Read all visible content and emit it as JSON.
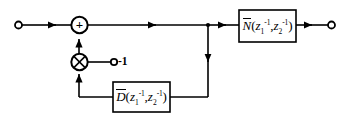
{
  "figure": {
    "kind": "signal-flow-block-diagram",
    "background_color": "#ffffff",
    "line_color": "#000000",
    "width": 351,
    "height": 124
  },
  "nodes": {
    "input_terminal": {
      "name": "input-terminal",
      "shape": "open-circle",
      "label": ""
    },
    "output_terminal": {
      "name": "output-terminal",
      "shape": "open-circle",
      "label": ""
    },
    "summing_junction": {
      "name": "summing-junction",
      "shape": "circle",
      "sign": "+"
    },
    "multiplier": {
      "name": "multiplier-node",
      "shape": "circle-with-cross",
      "symbol": "⊗"
    },
    "gain_terminal": {
      "name": "gain-terminal",
      "shape": "open-circle",
      "label": "-1"
    },
    "branch_point": {
      "name": "branch-point",
      "shape": "solid-dot"
    }
  },
  "blocks": [
    {
      "id": "numerator",
      "name": "numerator-block",
      "label_plain": "N̄(z₁⁻¹, z₂⁻¹)",
      "letter": "N",
      "overbar": true,
      "arg1_base": "z",
      "arg1_sub": "1",
      "arg1_sup": "-1",
      "arg2_base": "z",
      "arg2_sub": "2",
      "arg2_sup": "-1",
      "separator": ",",
      "open_paren": "(",
      "close_paren": ")"
    },
    {
      "id": "denominator",
      "name": "denominator-block",
      "label_plain": "D̄(z₁⁻¹, z₂⁻¹)",
      "letter": "D",
      "overbar": true,
      "arg1_base": "z",
      "arg1_sub": "1",
      "arg1_sup": "-1",
      "arg2_base": "z",
      "arg2_sub": "2",
      "arg2_sup": "-1",
      "separator": ",",
      "open_paren": "(",
      "close_paren": ")"
    }
  ],
  "labels": {
    "gain_value": "-1",
    "sum_sign": "+"
  }
}
